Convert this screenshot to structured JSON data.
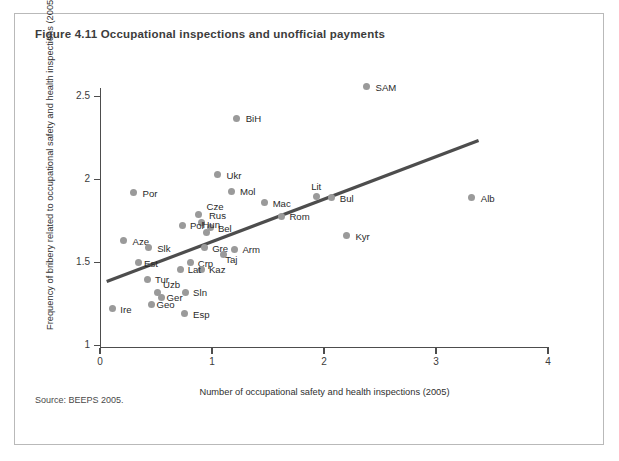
{
  "figure": {
    "title": "Figure 4.11  Occupational inspections and unofficial payments",
    "source": "Source: BEEPS 2005."
  },
  "chart_data": {
    "type": "scatter",
    "title": "Figure 4.11  Occupational inspections and unofficial payments",
    "xlabel": "Number of occupational safety and health inspections (2005)",
    "ylabel": "Frequency of bribery related to occupational safety and health inspections (2005)",
    "xlim": [
      0,
      4
    ],
    "ylim": [
      1,
      2.75
    ],
    "xticks": [
      0,
      1,
      2,
      3,
      4
    ],
    "xtick_labels": [
      "0",
      "1",
      "2",
      "3",
      "4"
    ],
    "yticks": [
      1,
      1.5,
      2,
      2.5
    ],
    "ytick_labels": [
      "1",
      "1.5",
      "2",
      "2.5"
    ],
    "grid": false,
    "legend": null,
    "marker_color": "#9a9a9a",
    "trendline_color": "#4d4d4d",
    "trendline": {
      "x_start": 0.06,
      "y_start": 1.385,
      "x_end": 3.38,
      "y_end": 2.235
    },
    "points": [
      {
        "label": "SAM",
        "x": 2.38,
        "y": 2.56,
        "label_dx": 9,
        "label_dy": -5
      },
      {
        "label": "BiH",
        "x": 1.22,
        "y": 2.37,
        "label_dx": 9,
        "label_dy": -5
      },
      {
        "label": "Ukr",
        "x": 1.05,
        "y": 2.03,
        "label_dx": 9,
        "label_dy": -5
      },
      {
        "label": "Por",
        "x": 0.3,
        "y": 1.92,
        "label_dx": 9,
        "label_dy": -5
      },
      {
        "label": "Mol",
        "x": 1.17,
        "y": 1.93,
        "label_dx": 9,
        "label_dy": -5
      },
      {
        "label": "Alb",
        "x": 3.32,
        "y": 1.89,
        "label_dx": 9,
        "label_dy": -5
      },
      {
        "label": "Lit",
        "x": 1.93,
        "y": 1.9,
        "label_dx": -5,
        "label_dy": -15
      },
      {
        "label": "Bul",
        "x": 2.07,
        "y": 1.89,
        "label_dx": 8,
        "label_dy": -5
      },
      {
        "label": "Mac",
        "x": 1.47,
        "y": 1.86,
        "label_dx": 8,
        "label_dy": -5
      },
      {
        "label": "Cze",
        "x": 0.88,
        "y": 1.79,
        "label_dx": 8,
        "label_dy": -13
      },
      {
        "label": "Rom",
        "x": 1.62,
        "y": 1.78,
        "label_dx": 8,
        "label_dy": -5
      },
      {
        "label": "Rus",
        "x": 0.91,
        "y": 1.74,
        "label_dx": 7,
        "label_dy": -13
      },
      {
        "label": "Pol",
        "x": 0.74,
        "y": 1.72,
        "label_dx": 7,
        "label_dy": -6
      },
      {
        "label": "Bel",
        "x": 0.99,
        "y": 1.71,
        "label_dx": 7,
        "label_dy": -5
      },
      {
        "label": "Hun",
        "x": 0.95,
        "y": 1.68,
        "label_dx": -4,
        "label_dy": -14
      },
      {
        "label": "Kyr",
        "x": 2.2,
        "y": 1.66,
        "label_dx": 9,
        "label_dy": -5
      },
      {
        "label": "Aze",
        "x": 0.21,
        "y": 1.63,
        "label_dx": 9,
        "label_dy": -5
      },
      {
        "label": "Slk",
        "x": 0.43,
        "y": 1.59,
        "label_dx": 9,
        "label_dy": -5
      },
      {
        "label": "Gre",
        "x": 0.93,
        "y": 1.59,
        "label_dx": 8,
        "label_dy": -5
      },
      {
        "label": "Arm",
        "x": 1.2,
        "y": 1.58,
        "label_dx": 8,
        "label_dy": -5
      },
      {
        "label": "Taj",
        "x": 1.1,
        "y": 1.55,
        "label_dx": 2,
        "label_dy": 0
      },
      {
        "label": "Est",
        "x": 0.34,
        "y": 1.5,
        "label_dx": 6,
        "label_dy": -5
      },
      {
        "label": "Crp",
        "x": 0.81,
        "y": 1.5,
        "label_dx": 7,
        "label_dy": -5
      },
      {
        "label": "Kaz",
        "x": 0.91,
        "y": 1.46,
        "label_dx": 7,
        "label_dy": -5
      },
      {
        "label": "Lat",
        "x": 0.72,
        "y": 1.46,
        "label_dx": 7,
        "label_dy": -5
      },
      {
        "label": "Tur",
        "x": 0.42,
        "y": 1.4,
        "label_dx": 8,
        "label_dy": -5
      },
      {
        "label": "Uzb",
        "x": 0.51,
        "y": 1.32,
        "label_dx": 6,
        "label_dy": -13
      },
      {
        "label": "Ger",
        "x": 0.55,
        "y": 1.29,
        "label_dx": 5,
        "label_dy": -5
      },
      {
        "label": "Sln",
        "x": 0.76,
        "y": 1.32,
        "label_dx": 8,
        "label_dy": -5
      },
      {
        "label": "Geo",
        "x": 0.46,
        "y": 1.25,
        "label_dx": 5,
        "label_dy": -5
      },
      {
        "label": "Ire",
        "x": 0.11,
        "y": 1.22,
        "label_dx": 8,
        "label_dy": -5
      },
      {
        "label": "Esp",
        "x": 0.75,
        "y": 1.19,
        "label_dx": 9,
        "label_dy": -5
      }
    ]
  }
}
